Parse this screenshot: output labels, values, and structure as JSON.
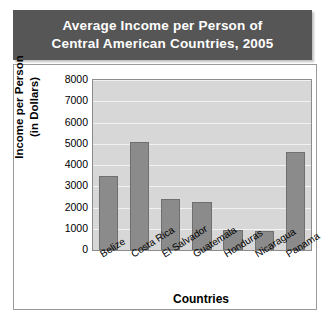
{
  "chart_data": {
    "type": "bar",
    "title": "Average Income per Person of Central American Countries, 2005",
    "title_lines": [
      "Average Income per Person of",
      "Central American Countries, 2005"
    ],
    "categories": [
      "Belize",
      "Costa Rica",
      "El Salvador",
      "Guatemala",
      "Honduras",
      "Nicaragua",
      "Panama"
    ],
    "values": [
      3500,
      5100,
      2400,
      2250,
      950,
      900,
      4600
    ],
    "xlabel": "Countries",
    "ylabel": "Income per Person (in Dollars)",
    "ylabel_lines": [
      "Income per Person",
      "(in Dollars)"
    ],
    "ylim": [
      0,
      8000
    ],
    "yticks": [
      8000,
      7000,
      6000,
      5000,
      4000,
      3000,
      2000,
      1000,
      0
    ],
    "ytick_labels": [
      "8000",
      "7000",
      "6000",
      "5000",
      "4000",
      "3000",
      "2000",
      "1000",
      "0"
    ],
    "grid": true,
    "legend": false,
    "colors": {
      "bar_fill": "#8b8b8b",
      "bar_edge": "#6f6f6f",
      "plot_background": "#d7d7d7",
      "gridline": "#f2f2f2",
      "title_banner": "#565656",
      "title_text": "#ffffff",
      "frame_border": "#9a9a9a"
    }
  }
}
